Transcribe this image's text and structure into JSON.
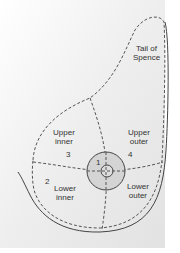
{
  "diagram": {
    "colors": {
      "background_gradient_start": "#ffffff",
      "background_gradient_end": "#e4e4e4",
      "outline": "#444444",
      "dashed": "#555555",
      "areola_fill": "#d4d4d4",
      "text": "#333333"
    },
    "labels": {
      "tail": {
        "line1": "Tail of",
        "line2": "Spence"
      },
      "upper_inner": {
        "line1": "Upper",
        "line2": "inner",
        "number": "3"
      },
      "upper_outer": {
        "line1": "Upper",
        "line2": "outer",
        "number": "4"
      },
      "lower_inner": {
        "line1": "Lower",
        "line2": "inner",
        "number": "2"
      },
      "lower_outer": {
        "line1": "Lower",
        "line2": "outer"
      },
      "central": {
        "number": "1"
      }
    }
  }
}
